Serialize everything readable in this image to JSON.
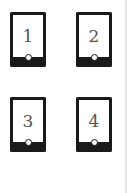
{
  "devices": [
    {
      "label": "1"
    },
    {
      "label": "2"
    },
    {
      "label": "3"
    },
    {
      "label": "4"
    }
  ],
  "colors": {
    "device_frame": "#1a1a1a",
    "number_text": "#555555",
    "background": "#ffffff"
  }
}
